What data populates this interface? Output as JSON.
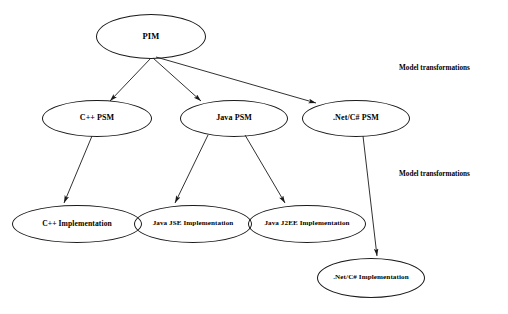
{
  "diagram": {
    "background_color": "#ffffff",
    "stroke_color": "#1a1a1a",
    "text_color": "#000000",
    "nodes": [
      {
        "id": "pim",
        "label": "PIM",
        "x": 96,
        "y": 14,
        "w": 110,
        "h": 45,
        "font_size": 8.5
      },
      {
        "id": "cpp_psm",
        "label": "C++ PSM",
        "x": 42,
        "y": 100,
        "w": 110,
        "h": 37,
        "font_size": 8.0
      },
      {
        "id": "java_psm",
        "label": "Java PSM",
        "x": 180,
        "y": 100,
        "w": 108,
        "h": 37,
        "font_size": 8.0
      },
      {
        "id": "net_psm",
        "label": ".Net/C# PSM",
        "x": 302,
        "y": 100,
        "w": 108,
        "h": 37,
        "font_size": 8.0
      },
      {
        "id": "cpp_impl",
        "label": "C++ Implementation",
        "x": 12,
        "y": 205,
        "w": 130,
        "h": 38,
        "font_size": 7.6
      },
      {
        "id": "jse_impl",
        "label": "Java JSE Implementation",
        "x": 134,
        "y": 205,
        "w": 118,
        "h": 38,
        "font_size": 7.1
      },
      {
        "id": "j2ee_impl",
        "label": "Java J2EE Implementation",
        "x": 248,
        "y": 205,
        "w": 118,
        "h": 38,
        "font_size": 7.1
      },
      {
        "id": "net_impl",
        "label": ".Net/C# Implementation",
        "x": 317,
        "y": 258,
        "w": 108,
        "h": 40,
        "font_size": 7.1
      }
    ],
    "edges": [
      {
        "id": "pim-to-cpp-psm",
        "from": "pim",
        "to": "cpp_psm",
        "x1": 151,
        "y1": 58,
        "x2": 110,
        "y2": 101
      },
      {
        "id": "pim-to-java-psm",
        "from": "pim",
        "to": "java_psm",
        "x1": 153,
        "y1": 58,
        "x2": 201,
        "y2": 101
      },
      {
        "id": "pim-to-net-psm",
        "from": "pim",
        "to": "net_psm",
        "x1": 156,
        "y1": 57,
        "x2": 316,
        "y2": 103
      },
      {
        "id": "cpp-psm-to-impl",
        "from": "cpp_psm",
        "to": "cpp_impl",
        "x1": 92,
        "y1": 136,
        "x2": 64,
        "y2": 203
      },
      {
        "id": "java-psm-to-jse",
        "from": "java_psm",
        "to": "jse_impl",
        "x1": 208,
        "y1": 135,
        "x2": 175,
        "y2": 203
      },
      {
        "id": "java-psm-to-j2ee",
        "from": "java_psm",
        "to": "j2ee_impl",
        "x1": 245,
        "y1": 135,
        "x2": 285,
        "y2": 203
      },
      {
        "id": "net-psm-to-impl",
        "from": "net_psm",
        "to": "net_impl",
        "x1": 363,
        "y1": 136,
        "x2": 377,
        "y2": 256
      }
    ],
    "annotations": [
      {
        "id": "model-transformations-upper",
        "label": "Model transformations",
        "x": 399,
        "y": 64,
        "font_size": 7.2
      },
      {
        "id": "model-transformations-lower",
        "label": "Model transformations",
        "x": 399,
        "y": 170,
        "font_size": 7.2
      }
    ]
  }
}
